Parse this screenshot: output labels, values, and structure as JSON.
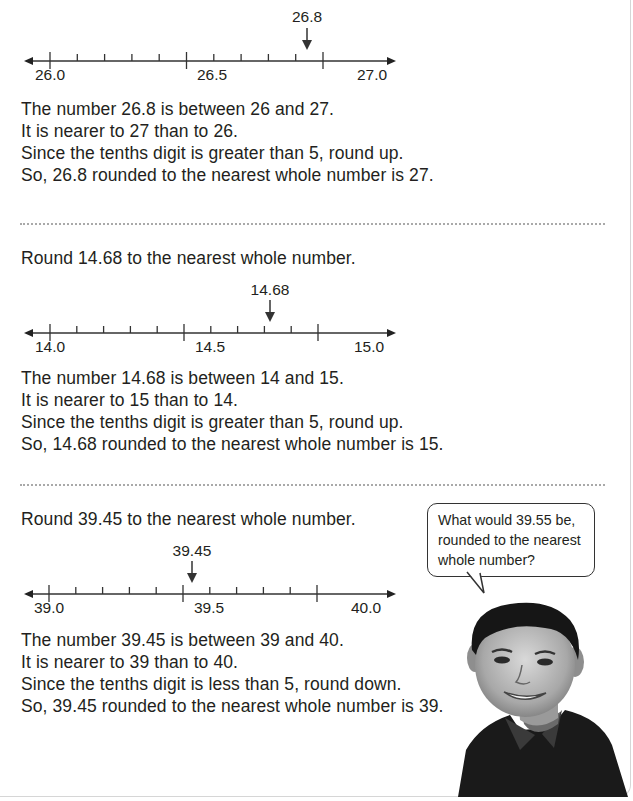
{
  "examples": [
    {
      "prompt": null,
      "number_line": {
        "start": 26.0,
        "end": 27.0,
        "step": 0.1,
        "labels": [
          "26.0",
          "26.5",
          "27.0"
        ],
        "marker_value": 26.8,
        "marker_label": "26.8"
      },
      "explanation": [
        "The number 26.8 is between 26 and 27.",
        "It is nearer to 27 than to 26.",
        "Since the tenths digit is greater than 5, round up.",
        "So, 26.8 rounded to the nearest whole number is 27."
      ]
    },
    {
      "prompt": "Round 14.68 to the nearest whole number.",
      "number_line": {
        "start": 14.0,
        "end": 15.0,
        "step": 0.1,
        "labels": [
          "14.0",
          "14.5",
          "15.0"
        ],
        "marker_value": 14.68,
        "marker_label": "14.68"
      },
      "explanation": [
        "The number 14.68 is between 14 and 15.",
        "It is nearer to 15 than to 14.",
        "Since the tenths digit is greater than 5, round up.",
        "So, 14.68 rounded to the nearest whole number is 15."
      ]
    },
    {
      "prompt": "Round 39.45 to the nearest whole number.",
      "number_line": {
        "start": 39.0,
        "end": 40.0,
        "step": 0.1,
        "labels": [
          "39.0",
          "39.5",
          "40.0"
        ],
        "marker_value": 39.45,
        "marker_label": "39.45"
      },
      "explanation": [
        "The number 39.45 is between 39 and 40.",
        "It is nearer to 39 than to 40.",
        "Since the tenths digit is less than 5, round down.",
        "So, 39.45 rounded to the nearest whole number is 39."
      ]
    }
  ],
  "speech_bubble": {
    "lines": [
      "What would 39.55 be,",
      "rounded to the nearest",
      "whole number?"
    ]
  },
  "illustration": {
    "subject": "smiling-boy-photo"
  },
  "colors": {
    "text": "#231f20",
    "line": "#333333",
    "dots": "#a9a9a9"
  }
}
